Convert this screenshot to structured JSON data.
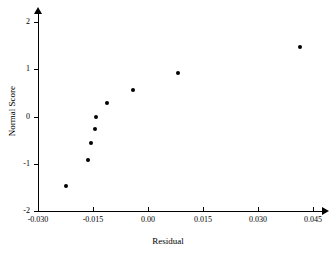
{
  "chart_data": {
    "type": "scatter",
    "title": "",
    "xlabel": "Residual",
    "ylabel": "Normal Score",
    "xlim": [
      -0.03,
      0.0455
    ],
    "ylim": [
      -2,
      2.18
    ],
    "grid": false,
    "legend": null,
    "xticks": [
      -0.03,
      -0.015,
      0.0,
      0.015,
      0.03,
      0.045
    ],
    "xticklabels": [
      "-0.030",
      "-0.015",
      "0.00",
      "0.015",
      "0.030",
      "0.045"
    ],
    "yticks": [
      -2,
      -1,
      0,
      1,
      2
    ],
    "yticklabels": [
      "-2",
      "-1",
      "0",
      "1",
      "2"
    ],
    "x": [
      -0.0225,
      -0.0163,
      -0.0155,
      -0.0145,
      -0.0143,
      -0.0112,
      -0.004,
      0.0083,
      0.0415
    ],
    "y": [
      -1.48,
      -0.93,
      -0.57,
      -0.27,
      0.0,
      0.28,
      0.57,
      0.93,
      1.48
    ],
    "points": [
      {
        "x": -0.0225,
        "y": -1.48
      },
      {
        "x": -0.0163,
        "y": -0.93
      },
      {
        "x": -0.0155,
        "y": -0.57
      },
      {
        "x": -0.0145,
        "y": -0.27
      },
      {
        "x": -0.0143,
        "y": 0.0
      },
      {
        "x": -0.0112,
        "y": 0.28
      },
      {
        "x": -0.004,
        "y": 0.57
      },
      {
        "x": 0.0083,
        "y": 0.93
      },
      {
        "x": 0.0415,
        "y": 1.48
      }
    ],
    "marker": "filled-circle",
    "marker_color": "#000000",
    "axis_color": "#000000"
  }
}
